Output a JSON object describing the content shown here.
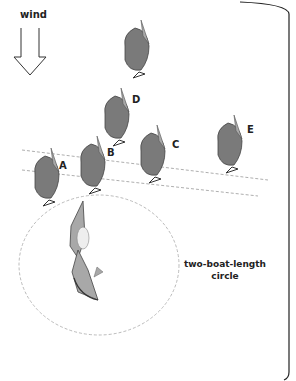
{
  "wind": {
    "label": "wind"
  },
  "boats": [
    {
      "id": "top",
      "label": ""
    },
    {
      "id": "D",
      "label": "D"
    },
    {
      "id": "A",
      "label": "A"
    },
    {
      "id": "B",
      "label": "B"
    },
    {
      "id": "C",
      "label": "C"
    },
    {
      "id": "E",
      "label": "E"
    }
  ],
  "circle": {
    "label_line1": "two-boat-length",
    "label_line2": "circle"
  },
  "colors": {
    "hull": "#7a7a7a",
    "sail": "#a8a8a8",
    "outline": "#333333",
    "dashed": "#999999"
  }
}
